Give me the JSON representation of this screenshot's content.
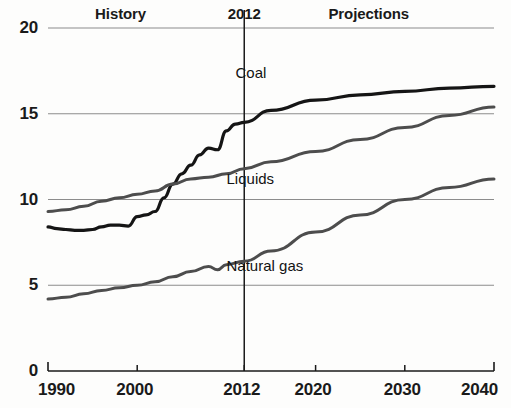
{
  "chart_data": {
    "type": "line",
    "title": "",
    "subtitle": "",
    "xlabel": "",
    "ylabel": "",
    "xlim": [
      1990,
      2040
    ],
    "ylim": [
      0,
      20
    ],
    "grid": true,
    "gridlines_y": [
      0,
      5,
      10,
      15,
      20
    ],
    "xticks": [
      "1990",
      "2000",
      "2012",
      "2020",
      "2030",
      "2040"
    ],
    "xtick_values": [
      1990,
      2000,
      2012,
      2020,
      2030,
      2040
    ],
    "yticks": [
      "0",
      "5",
      "10",
      "15",
      "20"
    ],
    "ytick_values": [
      0,
      5,
      10,
      15,
      20
    ],
    "legend_position": "inline-labels",
    "annotations": [
      {
        "name": "history-label",
        "text": "History",
        "x": 1998.5,
        "y": 20.8
      },
      {
        "name": "year-divider-label",
        "text": "2012",
        "x": 2012,
        "y": 20.8
      },
      {
        "name": "projections-label",
        "text": "Projections",
        "x": 2026.5,
        "y": 20.8
      }
    ],
    "divider": {
      "name": "year-2012-divider",
      "x": 2012,
      "label": "2012"
    },
    "series": [
      {
        "name": "Coal",
        "color": "#151515",
        "width": 3.2,
        "label_x": 2015.5,
        "label_y": 17.4,
        "x": [
          1990,
          1991,
          1992,
          1993,
          1994,
          1995,
          1996,
          1997,
          1998,
          1999,
          2000,
          2001,
          2002,
          2003,
          2004,
          2005,
          2006,
          2007,
          2008,
          2009,
          2010,
          2011,
          2012,
          2015,
          2020,
          2025,
          2030,
          2035,
          2040
        ],
        "values": [
          8.4,
          8.3,
          8.25,
          8.2,
          8.2,
          8.25,
          8.4,
          8.5,
          8.5,
          8.45,
          9.0,
          9.1,
          9.3,
          10.1,
          10.9,
          11.5,
          12.0,
          12.6,
          13.0,
          12.9,
          14.0,
          14.4,
          14.5,
          15.2,
          15.8,
          16.1,
          16.3,
          16.5,
          16.6
        ]
      },
      {
        "name": "Liquids",
        "color": "#4d4d4d",
        "width": 3.0,
        "label_x": 2014.5,
        "label_y": 11.2,
        "x": [
          1990,
          1992,
          1994,
          1996,
          1998,
          2000,
          2002,
          2004,
          2006,
          2008,
          2010,
          2012,
          2015,
          2020,
          2025,
          2030,
          2035,
          2040
        ],
        "values": [
          9.3,
          9.4,
          9.6,
          9.9,
          10.1,
          10.3,
          10.5,
          10.9,
          11.2,
          11.3,
          11.5,
          11.8,
          12.2,
          12.8,
          13.5,
          14.2,
          14.9,
          15.4
        ]
      },
      {
        "name": "Natural gas",
        "color": "#4d4d4d",
        "width": 3.0,
        "label_x": 2014.5,
        "label_y": 6.1,
        "x": [
          1990,
          1992,
          1994,
          1996,
          1998,
          2000,
          2002,
          2004,
          2006,
          2008,
          2009,
          2010,
          2012,
          2015,
          2020,
          2025,
          2030,
          2035,
          2040
        ],
        "values": [
          4.2,
          4.3,
          4.5,
          4.7,
          4.85,
          5.0,
          5.2,
          5.5,
          5.8,
          6.1,
          5.9,
          6.2,
          6.4,
          7.0,
          8.1,
          9.1,
          10.0,
          10.7,
          11.2
        ]
      }
    ]
  },
  "axes": {
    "y_axis_name": "value-axis",
    "x_axis_name": "year-axis"
  }
}
